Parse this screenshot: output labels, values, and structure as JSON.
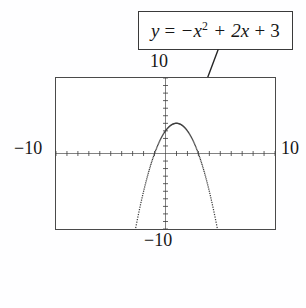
{
  "figure": {
    "type": "calculator-graph",
    "background_color": "#fefeff",
    "ink_color": "#1c1c1c"
  },
  "callout": {
    "equation_plain": "y = -x^2 + 2x + 3",
    "lhs": "y",
    "equals": "=",
    "term1": "−x",
    "exponent1": "2",
    "term2": "+ 2x",
    "term3": "+ 3",
    "border_color": "#3a3a3a"
  },
  "window": {
    "ymax_label": "10",
    "ymin_label": "−10",
    "xmin_label": "−10",
    "xmax_label": "10"
  },
  "chart_data": {
    "type": "line",
    "xlabel": "",
    "ylabel": "",
    "xlim": [
      -10,
      10
    ],
    "ylim": [
      -10,
      10
    ],
    "grid": false,
    "axis_ticks": true,
    "tick_spacing": 1,
    "legend": "none",
    "annotations": [
      {
        "text": "y = -x^2 + 2x + 3",
        "boxed": true,
        "leader_line": true
      }
    ],
    "series": [
      {
        "name": "y = -x^2 + 2x + 3",
        "style": "dotted",
        "x": [
          -2.5,
          -2.0,
          -1.5,
          -1.0,
          -0.5,
          0.0,
          0.5,
          1.0,
          1.5,
          2.0,
          2.5,
          3.0,
          3.5,
          4.0,
          4.5
        ],
        "y": [
          -8.25,
          -5.0,
          -2.25,
          0.0,
          1.75,
          3.0,
          3.75,
          4.0,
          3.75,
          3.0,
          1.75,
          0.0,
          -2.25,
          -5.0,
          -8.25
        ]
      }
    ],
    "vertex": [
      1,
      4
    ],
    "roots": [
      -1,
      3
    ],
    "y_intercept": 3
  }
}
